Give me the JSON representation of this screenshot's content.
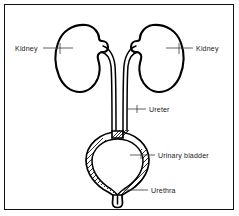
{
  "figure": {
    "frame_color": "#111111",
    "background_color": "#ffffff",
    "line_color": "#000000",
    "label_color": "#1a1a1a"
  },
  "labels": {
    "kidney_left": "Kidney",
    "kidney_right": "Kidney",
    "ureter": "Ureter",
    "urinary_bladder": "Urinary bladder",
    "urethra": "Urethra"
  },
  "parts": [
    {
      "name": "kidney-left",
      "label": "Kidney",
      "side": "left"
    },
    {
      "name": "kidney-right",
      "label": "Kidney",
      "side": "right"
    },
    {
      "name": "ureter",
      "label": "Ureter",
      "count": 2
    },
    {
      "name": "urinary-bladder",
      "label": "Urinary bladder"
    },
    {
      "name": "urethra",
      "label": "Urethra"
    }
  ]
}
